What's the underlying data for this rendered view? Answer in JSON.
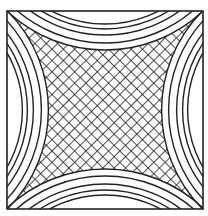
{
  "figure": {
    "stroke_color": "#222222",
    "background_color": "#ffffff",
    "frame": {
      "x": 7,
      "y": 11,
      "width": 196,
      "height": 198
    },
    "arcs_per_side": 5,
    "hatch_spacing": 8
  }
}
